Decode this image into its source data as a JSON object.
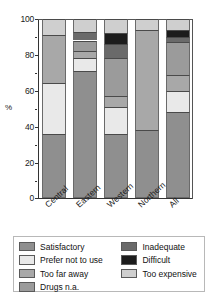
{
  "chart_data": {
    "type": "bar",
    "subtype": "stacked-bar-100",
    "title": "",
    "xlabel": "",
    "ylabel": "%",
    "ylim": [
      0,
      100
    ],
    "yticks": [
      0,
      20,
      40,
      60,
      80,
      100
    ],
    "ytick_labels": [
      "0",
      "20",
      "40",
      "60",
      "80",
      "100"
    ],
    "yminor_ticks": [
      10,
      30,
      50,
      70,
      90
    ],
    "grid": false,
    "legend_position": "bottom",
    "categories": [
      "Central",
      "Eastern",
      "Western",
      "Northern",
      "All"
    ],
    "series": [
      {
        "name": "Satisfactory",
        "color": "#8f8f8f",
        "values": [
          36,
          71,
          36,
          38,
          48
        ]
      },
      {
        "name": "Prefer not to use",
        "color": "#e9e9e9",
        "values": [
          28,
          7,
          15,
          0,
          12
        ]
      },
      {
        "name": "Too far away",
        "color": "#a8a8a8",
        "values": [
          27,
          4,
          6,
          56,
          9
        ]
      },
      {
        "name": "Drugs n.a.",
        "color": "#9b9b9b",
        "values": [
          0,
          6,
          21,
          0,
          18
        ]
      },
      {
        "name": "Inadequate",
        "color": "#6a6a6a",
        "values": [
          0,
          5,
          8,
          0,
          3
        ]
      },
      {
        "name": "Difficult",
        "color": "#1c1c1c",
        "values": [
          0,
          0,
          6,
          0,
          4
        ]
      },
      {
        "name": "Too expensive",
        "color": "#cfcfcf",
        "values": [
          9,
          7,
          8,
          6,
          6
        ]
      }
    ],
    "stack_order_bottom_to_top": [
      "Satisfactory",
      "Prefer not to use",
      "Too far away",
      "Drugs n.a.",
      "Inadequate",
      "Difficult",
      "Too expensive"
    ]
  },
  "axis": {
    "y_title": "%",
    "ticks": [
      "100",
      "80",
      "60",
      "40",
      "20",
      "0"
    ]
  },
  "legend": {
    "left_column": [
      {
        "label": "Satisfactory",
        "color": "#8f8f8f"
      },
      {
        "label": "Prefer not to use",
        "color": "#e9e9e9"
      },
      {
        "label": "Too far away",
        "color": "#a8a8a8"
      },
      {
        "label": "Drugs n.a.",
        "color": "#9b9b9b"
      }
    ],
    "right_column": [
      {
        "label": "Inadequate",
        "color": "#6a6a6a"
      },
      {
        "label": "Difficult",
        "color": "#1c1c1c"
      },
      {
        "label": "Too expensive",
        "color": "#cfcfcf"
      }
    ]
  }
}
